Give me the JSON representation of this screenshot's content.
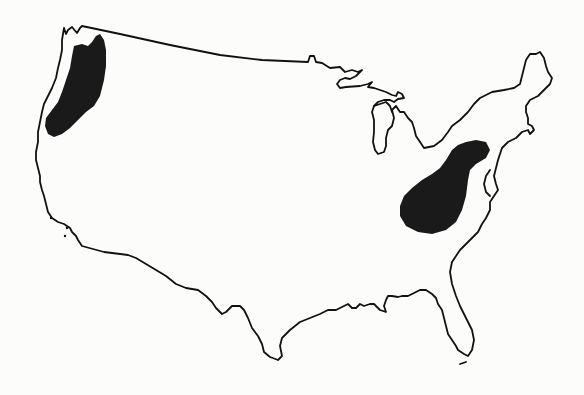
{
  "map": {
    "type": "outline-map",
    "subject": "Contiguous United States",
    "background_color": "#fcfcfb",
    "outline_color": "#111111",
    "shaded_regions": [
      {
        "id": "pacific-northwest",
        "description": "Western Washington and northwestern Oregon",
        "fill_color": "#1a1a1a"
      },
      {
        "id": "appalachian-ohio-valley",
        "description": "Appalachian / upper Ohio Valley region (West Virginia, Pennsylvania, eastern Kentucky)",
        "fill_color": "#1a1a1a"
      }
    ],
    "labels": []
  }
}
